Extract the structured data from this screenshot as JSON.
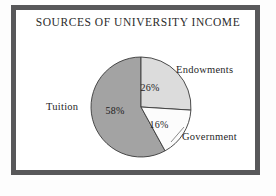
{
  "chart_data": {
    "type": "pie",
    "title": "SOURCES OF UNIVERSITY INCOME",
    "xlabel": "",
    "ylabel": "",
    "categories": [
      "Endowments",
      "Government",
      "Tuition"
    ],
    "values": [
      26,
      16,
      58
    ],
    "value_labels": [
      "26%",
      "16%",
      "58%"
    ],
    "units": "percent",
    "start_angle_deg": 0,
    "direction": "clockwise",
    "legend": "none",
    "grid": false,
    "slices": [
      {
        "label": "Endowments",
        "value": 26,
        "value_label": "26%",
        "color": "#dcdcdc"
      },
      {
        "label": "Government",
        "value": 16,
        "value_label": "16%",
        "color": "#fcfcfc"
      },
      {
        "label": "Tuition",
        "value": 58,
        "value_label": "58%",
        "color": "#a3a3a3"
      }
    ]
  },
  "colors": {
    "frame": "#58585a",
    "background": "#ffffff",
    "outline": "#3a3a3a",
    "text": "#1f1f1f",
    "tuition": "#a3a3a3",
    "endowments": "#dcdcdc",
    "government": "#fcfcfc"
  }
}
